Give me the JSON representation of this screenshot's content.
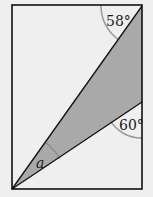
{
  "diagram": {
    "type": "geometry",
    "rectangle": {
      "x1": 12,
      "y1": 5,
      "x2": 142,
      "y2": 189
    },
    "shade_color": "#a9a9a9",
    "background_color": "#efefef",
    "arc_color": "#9a9a9a",
    "line_color": "#111111",
    "angles": {
      "top": {
        "label": "58°",
        "value": 58
      },
      "right": {
        "label": "60°",
        "value": 60
      },
      "unknown": {
        "label": "a"
      }
    }
  }
}
